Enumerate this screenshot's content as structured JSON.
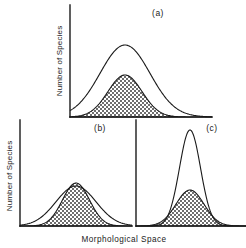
{
  "figure": {
    "background_color": "#ffffff",
    "line_color": "#1a1a1a",
    "hatch_color": "#4d4d4d",
    "x_axis_label": "Morphological  Space",
    "y_axis_label_a": "Number of  Species",
    "y_axis_label_b": "Number of  Species"
  },
  "panels": [
    {
      "id": "a",
      "label": "(a)",
      "label_x": 158,
      "label_y": 16,
      "axis": {
        "x": 70,
        "y_top": 5,
        "y_bottom": 117,
        "x_right": 212
      },
      "y_label": "Number of  Species",
      "y_label_x": 62,
      "y_label_y": 61,
      "curves": [
        {
          "name": "outer",
          "center": 125,
          "sigma": 25.0,
          "peak_y": 45,
          "filled": false
        },
        {
          "name": "shaded",
          "center": 125,
          "sigma": 17.0,
          "peak_y": 75,
          "filled": true
        }
      ]
    },
    {
      "id": "b",
      "label": "(b)",
      "label_x": 100,
      "label_y": 131,
      "axis": {
        "x": 20,
        "y_top": 120,
        "y_bottom": 226,
        "x_right": 132
      },
      "y_label": "Number of  Species",
      "y_label_x": 12,
      "y_label_y": 176,
      "curves": [
        {
          "name": "outer",
          "center": 76,
          "sigma": 20.0,
          "peak_y": 186,
          "filled": false
        },
        {
          "name": "shaded",
          "center": 76,
          "sigma": 13.5,
          "peak_y": 183,
          "filled": true
        }
      ]
    },
    {
      "id": "c",
      "label": "(c)",
      "label_x": 212,
      "label_y": 131,
      "axis": {
        "x": 136,
        "y_top": 120,
        "y_bottom": 226,
        "x_right": 246
      },
      "y_label": null,
      "curves": [
        {
          "name": "outer",
          "center": 190,
          "sigma": 10.5,
          "peak_y": 130,
          "filled": false
        },
        {
          "name": "shaded",
          "center": 190,
          "sigma": 14.0,
          "peak_y": 190,
          "filled": true
        }
      ]
    }
  ],
  "chart_data": {
    "type": "line",
    "title": "",
    "xlabel": "Morphological  Space",
    "ylabel": "Number of  Species",
    "grid": false,
    "legend": "none",
    "panels": [
      {
        "panel": "(a)",
        "series": [
          {
            "name": "total species pool",
            "shape": "gaussian",
            "mean": 0.5,
            "sd": 0.22,
            "relative_peak": 1.0,
            "shaded": false
          },
          {
            "name": "subset",
            "shape": "gaussian",
            "mean": 0.5,
            "sd": 0.15,
            "relative_peak": 0.62,
            "shaded": true
          }
        ]
      },
      {
        "panel": "(b)",
        "series": [
          {
            "name": "total species pool",
            "shape": "gaussian",
            "mean": 0.5,
            "sd": 0.19,
            "relative_peak": 1.0,
            "shaded": false
          },
          {
            "name": "subset",
            "shape": "gaussian",
            "mean": 0.5,
            "sd": 0.13,
            "relative_peak": 0.97,
            "shaded": true
          }
        ]
      },
      {
        "panel": "(c)",
        "series": [
          {
            "name": "total species pool",
            "shape": "gaussian",
            "mean": 0.5,
            "sd": 0.1,
            "relative_peak": 1.0,
            "shaded": false
          },
          {
            "name": "subset",
            "shape": "gaussian",
            "mean": 0.5,
            "sd": 0.13,
            "relative_peak": 0.44,
            "shaded": true
          }
        ]
      }
    ],
    "xlim": [
      0,
      1
    ],
    "ylim": [
      0,
      1
    ]
  }
}
